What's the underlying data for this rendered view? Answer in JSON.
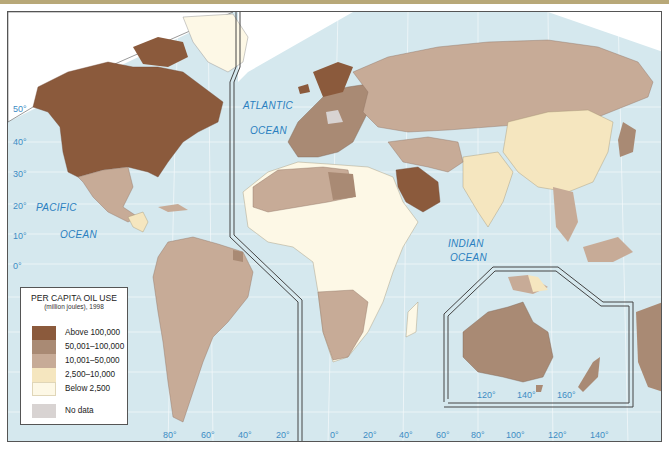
{
  "map": {
    "title": "PER CAPITA OIL USE",
    "subtitle": "(million joules), 1998",
    "colors": {
      "ocean": "#d5e8ee",
      "above_100000": "#8b5a3c",
      "c50001_100000": "#a98a74",
      "c10001_50000": "#c7ab97",
      "c2500_10000": "#f5e6bf",
      "below_2500": "#fdf8e6",
      "no_data": "#d8d3d2",
      "label_blue": "#2a7fc0"
    },
    "legend": [
      {
        "label": "Above 100,000",
        "color": "#8b5a3c"
      },
      {
        "label": "50,001–100,000",
        "color": "#a98a74"
      },
      {
        "label": "10,001–50,000",
        "color": "#c7ab97"
      },
      {
        "label": "2,500–10,000",
        "color": "#f5e6bf"
      },
      {
        "label": "Below 2,500",
        "color": "#fdf8e6"
      },
      {
        "label": "No data",
        "color": "#d8d3d2"
      }
    ],
    "oceans": [
      {
        "name": "PACIFIC"
      },
      {
        "name": "OCEAN"
      },
      {
        "name": "ATLANTIC"
      },
      {
        "name": "OCEAN"
      },
      {
        "name": "INDIAN"
      },
      {
        "name": "OCEAN"
      }
    ],
    "latitude_labels": [
      "50°",
      "40°",
      "30°",
      "20°",
      "10°",
      "0°"
    ],
    "longitude_labels_west": [
      "80°",
      "60°",
      "40°",
      "20°"
    ],
    "longitude_labels_east": [
      "0°",
      "20°",
      "40°",
      "60°",
      "80°",
      "100°",
      "120°",
      "140°"
    ],
    "inset_longitude_labels": [
      "120°",
      "140°",
      "160°"
    ],
    "regions": [
      {
        "name": "North America (US/Canada)",
        "category": "Above 100,000"
      },
      {
        "name": "Greenland",
        "category": "Below 2,500"
      },
      {
        "name": "Mexico",
        "category": "10,001–50,000"
      },
      {
        "name": "Central America",
        "category": "2,500–10,000"
      },
      {
        "name": "South America",
        "category": "10,001–50,000"
      },
      {
        "name": "Europe",
        "category": "50,001–100,000"
      },
      {
        "name": "Russia",
        "category": "10,001–50,000"
      },
      {
        "name": "Saudi Arabia",
        "category": "Above 100,000"
      },
      {
        "name": "North Africa",
        "category": "10,001–50,000"
      },
      {
        "name": "Libya",
        "category": "50,001–100,000"
      },
      {
        "name": "Central Africa",
        "category": "Below 2,500"
      },
      {
        "name": "Southern Africa",
        "category": "10,001–50,000"
      },
      {
        "name": "China",
        "category": "2,500–10,000"
      },
      {
        "name": "India",
        "category": "2,500–10,000"
      },
      {
        "name": "Japan",
        "category": "50,001–100,000"
      },
      {
        "name": "Australia",
        "category": "50,001–100,000"
      },
      {
        "name": "Papua New Guinea",
        "category": "2,500–10,000"
      }
    ]
  }
}
